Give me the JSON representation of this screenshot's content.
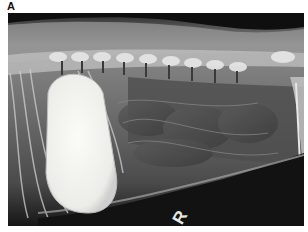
{
  "figure": {
    "panel_label": "A",
    "image": {
      "description": "Lateral abdominal/thoracic radiograph showing spine with vertebrae along the top, ribs on the left, and a large bright radiopaque oval mass in the left-center region",
      "side_marker": "R"
    },
    "colors": {
      "background": "#ffffff",
      "film_dark": "#0e0e0e",
      "soft_tissue": "#6a6a6a",
      "bone": "#d8d8d8",
      "opaque_mass": "#f4f4f0"
    }
  }
}
